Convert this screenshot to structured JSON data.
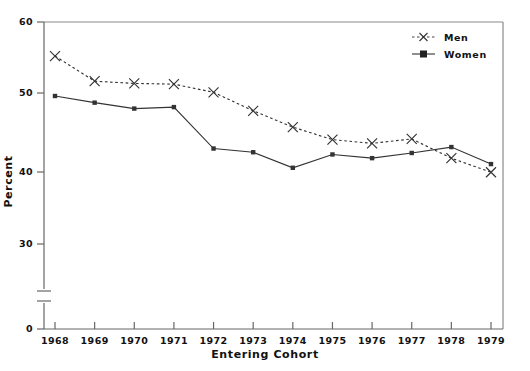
{
  "chart_data": {
    "type": "line",
    "title": "",
    "xlabel": "Entering Cohort",
    "ylabel": "Percent",
    "categories": [
      "1968",
      "1969",
      "1970",
      "1971",
      "1972",
      "1973",
      "1974",
      "1975",
      "1976",
      "1977",
      "1978",
      "1979"
    ],
    "x": [
      1968,
      1969,
      1970,
      1971,
      1972,
      1973,
      1974,
      1975,
      1976,
      1977,
      1978,
      1979
    ],
    "series": [
      {
        "name": "Men",
        "marker": "x",
        "linestyle": "dotted",
        "color": "#333333",
        "values": [
          55.4,
          52.0,
          51.7,
          51.6,
          50.5,
          48.0,
          45.8,
          44.1,
          43.6,
          44.2,
          41.6,
          39.7
        ]
      },
      {
        "name": "Women",
        "marker": "square",
        "linestyle": "solid",
        "color": "#333333",
        "values": [
          50.0,
          49.1,
          48.3,
          48.5,
          42.9,
          42.4,
          40.3,
          42.1,
          41.6,
          42.3,
          43.1,
          40.8
        ]
      }
    ],
    "ylim": [
      30,
      60
    ],
    "ytick_labels": [
      "60",
      "50",
      "40",
      "30",
      "0"
    ],
    "ytick_values": [
      60,
      50,
      40,
      30,
      0
    ],
    "y_axis_break": true,
    "grid": false,
    "legend_position": "top-right",
    "frame": "box"
  },
  "legend": {
    "entries": [
      {
        "label": "Men"
      },
      {
        "label": "Women"
      }
    ]
  },
  "colors": {
    "axis": "#555555",
    "frame": "#777777",
    "men": "#333333",
    "women": "#222222",
    "text": "#111111"
  }
}
